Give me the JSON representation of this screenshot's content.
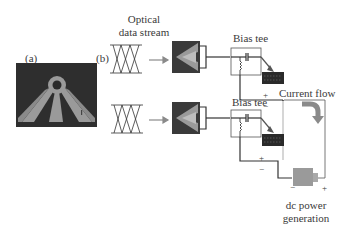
{
  "panels": {
    "a": {
      "label": "(a)"
    },
    "b": {
      "label": "(b)"
    }
  },
  "labels": {
    "optical_line1": "Optical",
    "optical_line2": "data stream",
    "bias_tee_top": "Bias tee",
    "bias_tee_bottom": "Bias tee",
    "current_flow": "Current flow",
    "dc_line1": "dc power",
    "dc_line2": "generation",
    "plus_top": "+",
    "minus_top": "−",
    "plus_bottom": "+",
    "minus_bottom": "−",
    "dc_minus": "−",
    "dc_plus": "+"
  },
  "colors": {
    "micrograph_bg": "#2e2e2e",
    "device_arms": "#9a9a9a",
    "chip_bg": "#3a3a3a",
    "wire": "#333333",
    "arrow_grey": "#8a8a8a",
    "dc_box": "#9a9a9a"
  }
}
